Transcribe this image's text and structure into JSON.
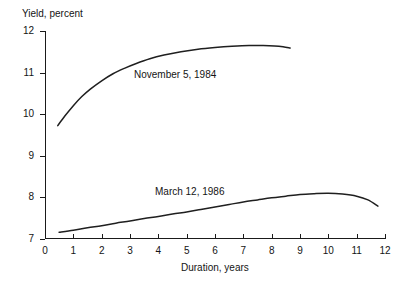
{
  "chart_data": {
    "type": "line",
    "title": "",
    "xlabel": "Duration, years",
    "ylabel": "Yield, percent",
    "xlim": [
      0,
      12
    ],
    "ylim": [
      7,
      12
    ],
    "grid": false,
    "legend_position": "inline-annotations",
    "xticks": [
      "0",
      "1",
      "2",
      "3",
      "4",
      "5",
      "6",
      "7",
      "8",
      "9",
      "10",
      "11",
      "12"
    ],
    "yticks": [
      "7",
      "8",
      "9",
      "10",
      "11",
      "12"
    ],
    "series": [
      {
        "name": "November 5, 1984",
        "label_x": 3.0,
        "label_y": 11.12,
        "x": [
          0.45,
          0.7,
          1.0,
          1.3,
          1.6,
          2.0,
          2.4,
          2.8,
          3.2,
          3.7,
          4.2,
          4.8,
          5.4,
          6.0,
          6.6,
          7.2,
          7.7,
          8.1,
          8.4,
          8.65
        ],
        "values": [
          9.72,
          9.95,
          10.2,
          10.42,
          10.6,
          10.8,
          10.97,
          11.1,
          11.21,
          11.33,
          11.42,
          11.5,
          11.56,
          11.6,
          11.63,
          11.65,
          11.65,
          11.64,
          11.62,
          11.59
        ]
      },
      {
        "name": "March 12, 1986",
        "label_x": 3.95,
        "label_y": 7.92,
        "x": [
          0.5,
          1.0,
          1.5,
          2.0,
          2.5,
          3.0,
          3.5,
          4.0,
          4.5,
          5.0,
          5.5,
          6.0,
          6.5,
          7.0,
          7.5,
          8.0,
          8.5,
          9.0,
          9.5,
          10.0,
          10.5,
          11.0,
          11.4,
          11.75
        ],
        "values": [
          7.15,
          7.2,
          7.26,
          7.31,
          7.37,
          7.42,
          7.48,
          7.53,
          7.59,
          7.64,
          7.7,
          7.76,
          7.82,
          7.88,
          7.93,
          7.98,
          8.02,
          8.06,
          8.08,
          8.09,
          8.07,
          8.02,
          7.93,
          7.78
        ]
      }
    ]
  }
}
